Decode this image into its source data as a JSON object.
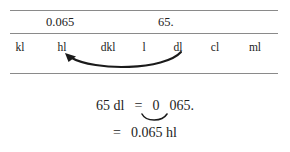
{
  "figure": {
    "value_row": {
      "left_value": "0.065",
      "right_value": "65."
    },
    "units": [
      {
        "id": "kl",
        "label": "kl"
      },
      {
        "id": "hl",
        "label": "hl"
      },
      {
        "id": "dkl",
        "label": "dkl"
      },
      {
        "id": "l",
        "label": "l"
      },
      {
        "id": "dl",
        "label": "dl"
      },
      {
        "id": "cl",
        "label": "cl"
      },
      {
        "id": "ml",
        "label": "ml"
      }
    ],
    "arrow": {
      "name": "curved-left-arrow",
      "from_unit": "dl",
      "to_unit": "hl",
      "direction": "right-to-left",
      "color": "#1a1a1a"
    },
    "equations": {
      "line1": {
        "left_side": "65 dl",
        "equals": "=",
        "right_before_gap": "0",
        "right_after_gap": "065.",
        "tie_mark": "decimal-shift-tie"
      },
      "line2": {
        "equals": "=",
        "result": "0.065 hl"
      }
    },
    "colors": {
      "rule": "#8a8a8a",
      "text": "#1a1a1a",
      "background": "#ffffff"
    }
  }
}
